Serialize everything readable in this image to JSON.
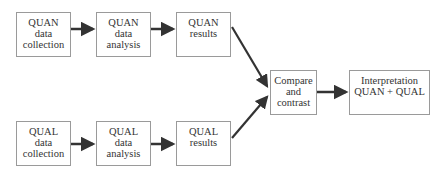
{
  "diagram": {
    "type": "flowchart",
    "colors": {
      "border": "#9a9a9a",
      "arrow": "#333333",
      "text": "#333333",
      "background": "#ffffff"
    },
    "nodes": [
      {
        "id": "quan_collection",
        "lines": [
          "QUAN",
          "data",
          "collection"
        ]
      },
      {
        "id": "quan_analysis",
        "lines": [
          "QUAN",
          "data",
          "analysis"
        ]
      },
      {
        "id": "quan_results",
        "lines": [
          "QUAN",
          "results"
        ]
      },
      {
        "id": "qual_collection",
        "lines": [
          "QUAL",
          "data",
          "collection"
        ]
      },
      {
        "id": "qual_analysis",
        "lines": [
          "QUAL",
          "data",
          "analysis"
        ]
      },
      {
        "id": "qual_results",
        "lines": [
          "QUAL",
          "results"
        ]
      },
      {
        "id": "compare",
        "lines": [
          "Compare",
          "and",
          "contrast"
        ]
      },
      {
        "id": "interpretation",
        "lines": [
          "Interpretation",
          "QUAN + QUAL"
        ]
      }
    ],
    "edges": [
      {
        "from": "quan_collection",
        "to": "quan_analysis"
      },
      {
        "from": "quan_analysis",
        "to": "quan_results"
      },
      {
        "from": "quan_results",
        "to": "compare"
      },
      {
        "from": "qual_collection",
        "to": "qual_analysis"
      },
      {
        "from": "qual_analysis",
        "to": "qual_results"
      },
      {
        "from": "qual_results",
        "to": "compare"
      },
      {
        "from": "compare",
        "to": "interpretation"
      }
    ]
  }
}
